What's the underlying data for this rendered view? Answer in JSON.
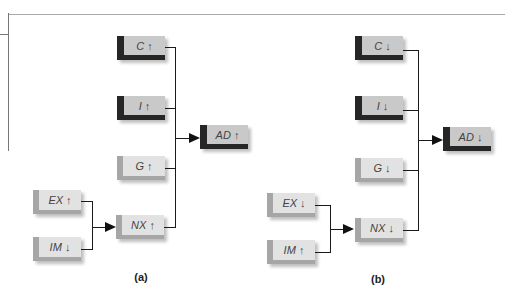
{
  "panels": [
    {
      "label": "(a)",
      "boxes": {
        "C": "C ↑",
        "I": "I ↑",
        "G": "G ↑",
        "NX": "NX ↑",
        "EX": "EX ↑",
        "IM": "IM ↓",
        "AD": "AD ↑"
      }
    },
    {
      "label": "(b)",
      "boxes": {
        "C": "C ↓",
        "I": "I ↓",
        "G": "G ↓",
        "NX": "NX ↓",
        "EX": "EX ↓",
        "IM": "IM ↑",
        "AD": "AD ↓"
      }
    }
  ],
  "colors": {
    "dark_accent": "#262626",
    "light_accent": "#a6a6a6",
    "dark_box_face": "#c9c9c9",
    "light_box_face": "#e2e2e2"
  }
}
